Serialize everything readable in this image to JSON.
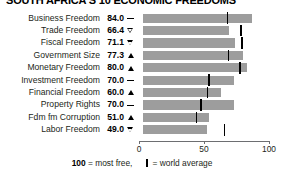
{
  "title": "SOUTH AFRICA'S 10 ECONOMIC FREEDOMS",
  "axis": {
    "ticks": [
      "0",
      "50",
      "100"
    ],
    "min": 0,
    "max": 100
  },
  "footer": {
    "most_free_value": "100",
    "most_free_text": " = most free,",
    "world_avg_text": " = world average"
  },
  "colors": {
    "bar": "#9d9d9d",
    "world_average": "#000000",
    "axis": "#6d6e71",
    "text": "#231f20"
  },
  "chart_data": {
    "type": "bar",
    "title": "SOUTH AFRICA'S 10 ECONOMIC FREEDOMS",
    "xlabel": "",
    "ylabel": "",
    "xlim": [
      0,
      100
    ],
    "grid": false,
    "legend": "100 = most free, | = world average",
    "categories": [
      "Business Freedom",
      "Trade Freedom",
      "Fiscal Freedom",
      "Government Size",
      "Monetary Freedom",
      "Investment Freedom",
      "Financial Freedom",
      "Property Rights",
      "Fdm fm Corruption",
      "Labor Freedom"
    ],
    "values": [
      84.0,
      66.4,
      71.1,
      77.3,
      80.0,
      70.0,
      60.0,
      70.0,
      51.0,
      49.0
    ],
    "value_labels": [
      "84.0",
      "66.4",
      "71.1",
      "77.3",
      "80.0",
      "70.0",
      "60.0",
      "70.0",
      "51.0",
      "49.0"
    ],
    "trend_markers": [
      "dash",
      "down",
      "down",
      "up",
      "up",
      "dash",
      "up",
      "dash",
      "up",
      "down"
    ],
    "world_average": [
      64.3,
      74.8,
      75.4,
      65.0,
      73.9,
      50.0,
      49.0,
      44.0,
      40.5,
      62.1
    ],
    "series": [
      {
        "name": "South Africa score",
        "values": [
          84.0,
          66.4,
          71.1,
          77.3,
          80.0,
          70.0,
          60.0,
          70.0,
          51.0,
          49.0
        ]
      },
      {
        "name": "World average",
        "values": [
          64.3,
          74.8,
          75.4,
          65.0,
          73.9,
          50.0,
          49.0,
          44.0,
          40.5,
          62.1
        ]
      }
    ]
  }
}
